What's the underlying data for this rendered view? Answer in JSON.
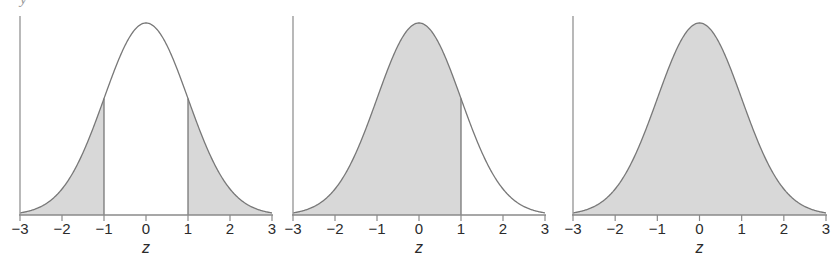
{
  "figure": {
    "width": 839,
    "height": 260,
    "background": "#ffffff",
    "clipped_top_label": "y",
    "curve_color": "#787878",
    "fill_color": "#d8d8d8",
    "axis_color": "#8a8a8a",
    "text_color": "#2b2b2b"
  },
  "chart_data": [
    {
      "type": "area",
      "title": "",
      "subtitle": "",
      "xlabel": "z",
      "ylabel": "",
      "distribution": "standard normal",
      "mean": 0,
      "sd": 1,
      "xlim": [
        -3,
        3
      ],
      "ylim": [
        0,
        0.4
      ],
      "grid": false,
      "legend": "none",
      "tick_labels": [
        "−3",
        "−2",
        "−1",
        "0",
        "1",
        "2",
        "3"
      ],
      "tick_values": [
        -3,
        -2,
        -1,
        0,
        1,
        2,
        3
      ],
      "shaded_regions": [
        {
          "from": -3,
          "to": -1
        },
        {
          "from": 1,
          "to": 3
        }
      ],
      "boundary_lines": [
        -1,
        1
      ],
      "description": "Two-tailed shading outside z = −1 and z = 1",
      "x": [
        -3.0,
        -2.8,
        -2.6,
        -2.4,
        -2.2,
        -2.0,
        -1.8,
        -1.6,
        -1.4,
        -1.2,
        -1.0,
        -0.8,
        -0.6,
        -0.4,
        -0.2,
        0.0,
        0.2,
        0.4,
        0.6,
        0.8,
        1.0,
        1.2,
        1.4,
        1.6,
        1.8,
        2.0,
        2.2,
        2.4,
        2.6,
        2.8,
        3.0
      ],
      "y": [
        0.0044,
        0.0079,
        0.0136,
        0.0224,
        0.0355,
        0.054,
        0.079,
        0.1109,
        0.1497,
        0.1942,
        0.242,
        0.2897,
        0.3332,
        0.3683,
        0.391,
        0.3989,
        0.391,
        0.3683,
        0.3332,
        0.2897,
        0.242,
        0.1942,
        0.1497,
        0.1109,
        0.079,
        0.054,
        0.0355,
        0.0224,
        0.0136,
        0.0079,
        0.0044
      ]
    },
    {
      "type": "area",
      "title": "",
      "subtitle": "",
      "xlabel": "z",
      "ylabel": "",
      "distribution": "standard normal",
      "mean": 0,
      "sd": 1,
      "xlim": [
        -3,
        3
      ],
      "ylim": [
        0,
        0.4
      ],
      "grid": false,
      "legend": "none",
      "tick_labels": [
        "−3",
        "−2",
        "−1",
        "0",
        "1",
        "2",
        "3"
      ],
      "tick_values": [
        -3,
        -2,
        -1,
        0,
        1,
        2,
        3
      ],
      "shaded_regions": [
        {
          "from": -3,
          "to": 1
        }
      ],
      "boundary_lines": [
        1
      ],
      "description": "Left-tail cumulative shading up to z = 1",
      "x": [
        -3.0,
        -2.8,
        -2.6,
        -2.4,
        -2.2,
        -2.0,
        -1.8,
        -1.6,
        -1.4,
        -1.2,
        -1.0,
        -0.8,
        -0.6,
        -0.4,
        -0.2,
        0.0,
        0.2,
        0.4,
        0.6,
        0.8,
        1.0,
        1.2,
        1.4,
        1.6,
        1.8,
        2.0,
        2.2,
        2.4,
        2.6,
        2.8,
        3.0
      ],
      "y": [
        0.0044,
        0.0079,
        0.0136,
        0.0224,
        0.0355,
        0.054,
        0.079,
        0.1109,
        0.1497,
        0.1942,
        0.242,
        0.2897,
        0.3332,
        0.3683,
        0.391,
        0.3989,
        0.391,
        0.3683,
        0.3332,
        0.2897,
        0.242,
        0.1942,
        0.1497,
        0.1109,
        0.079,
        0.054,
        0.0355,
        0.0224,
        0.0136,
        0.0079,
        0.0044
      ]
    },
    {
      "type": "area",
      "title": "",
      "subtitle": "",
      "xlabel": "z",
      "ylabel": "",
      "distribution": "standard normal",
      "mean": 0,
      "sd": 1,
      "xlim": [
        -3,
        3
      ],
      "ylim": [
        0,
        0.4
      ],
      "grid": false,
      "legend": "none",
      "tick_labels": [
        "−3",
        "−2",
        "−1",
        "0",
        "1",
        "2",
        "3"
      ],
      "tick_values": [
        -3,
        -2,
        -1,
        0,
        1,
        2,
        3
      ],
      "shaded_regions": [
        {
          "from": -3,
          "to": 3
        }
      ],
      "boundary_lines": [],
      "description": "Entire area under the curve shaded",
      "x": [
        -3.0,
        -2.8,
        -2.6,
        -2.4,
        -2.2,
        -2.0,
        -1.8,
        -1.6,
        -1.4,
        -1.2,
        -1.0,
        -0.8,
        -0.6,
        -0.4,
        -0.2,
        0.0,
        0.2,
        0.4,
        0.6,
        0.8,
        1.0,
        1.2,
        1.4,
        1.6,
        1.8,
        2.0,
        2.2,
        2.4,
        2.6,
        2.8,
        3.0
      ],
      "y": [
        0.0044,
        0.0079,
        0.0136,
        0.0224,
        0.0355,
        0.054,
        0.079,
        0.1109,
        0.1497,
        0.1942,
        0.242,
        0.2897,
        0.3332,
        0.3683,
        0.391,
        0.3989,
        0.391,
        0.3683,
        0.3332,
        0.2897,
        0.242,
        0.1942,
        0.1497,
        0.1109,
        0.079,
        0.054,
        0.0355,
        0.0224,
        0.0136,
        0.0079,
        0.0044
      ]
    }
  ],
  "panels": [
    {
      "name": "panel-two-tailed",
      "left": 0,
      "width": 282,
      "axis_x0": 20,
      "axis_x1": 272,
      "has_y_axis": true
    },
    {
      "name": "panel-left-tail",
      "left": 279,
      "width": 282,
      "axis_x0": 14,
      "axis_x1": 266,
      "has_y_axis": true
    },
    {
      "name": "panel-full-area",
      "left": 559,
      "width": 280,
      "axis_x0": 14,
      "axis_x1": 267,
      "has_y_axis": true
    }
  ]
}
